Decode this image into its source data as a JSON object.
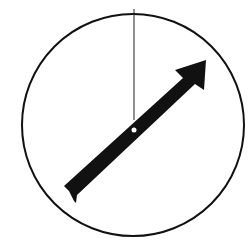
{
  "diagram": {
    "type": "dial-with-arrow",
    "background": "#ffffff",
    "stroke_color": "#111111",
    "circle": {
      "cx": 133,
      "cy": 125,
      "r": 111,
      "stroke_width": 2
    },
    "reference_line": {
      "x1": 134,
      "y1": 9,
      "x2": 134,
      "y2": 120,
      "stroke_width": 1
    },
    "arrow": {
      "fill": "#111111",
      "tail": [
        66,
        191
      ],
      "tip": [
        205,
        60
      ],
      "direction": "up-right"
    },
    "pivot": {
      "cx": 134,
      "cy": 130,
      "r": 2.5,
      "fill": "#ffffff"
    }
  }
}
